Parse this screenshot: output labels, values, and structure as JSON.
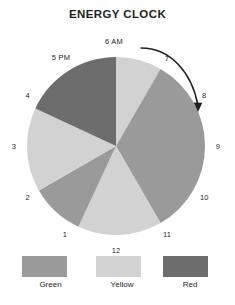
{
  "title": "ENERGY CLOCK",
  "colors": {
    "green": "#9a9a9a",
    "yellow": "#d2d2d2",
    "red": "#6d6d6d",
    "text": "#231f20",
    "background": "#ffffff",
    "arrow": "#231f20"
  },
  "legend": {
    "items": [
      {
        "label": "Green",
        "color": "#9a9a9a"
      },
      {
        "label": "Yellow",
        "color": "#d2d2d2"
      },
      {
        "label": "Red",
        "color": "#6d6d6d"
      }
    ]
  },
  "clock": {
    "labels": [
      {
        "text": "6 AM",
        "hour": 0
      },
      {
        "text": "7",
        "hour": 1
      },
      {
        "text": "8",
        "hour": 2
      },
      {
        "text": "9",
        "hour": 3
      },
      {
        "text": "10",
        "hour": 4
      },
      {
        "text": "11",
        "hour": 5
      },
      {
        "text": "12",
        "hour": 6
      },
      {
        "text": "1",
        "hour": 7
      },
      {
        "text": "2",
        "hour": 8
      },
      {
        "text": "3",
        "hour": 9
      },
      {
        "text": "4",
        "hour": 10
      },
      {
        "text": "5 PM",
        "hour": 11
      }
    ]
  },
  "arrow": {
    "name": "clockwise-direction-arrow",
    "from_label": "6 AM",
    "to_label": "9",
    "direction": "clockwise"
  },
  "chart_data": {
    "type": "pie",
    "title": "ENERGY CLOCK",
    "xlabel": "",
    "ylabel": "",
    "legend_position": "bottom",
    "start_angle_label": "6 AM",
    "rotation_deg": 0,
    "categories": [
      "Green",
      "Yellow",
      "Red"
    ],
    "category_colors": [
      "#9a9a9a",
      "#d2d2d2",
      "#6d6d6d"
    ],
    "slices": [
      {
        "category": "Yellow",
        "start_deg": 0,
        "end_deg": 30,
        "span_deg": 30,
        "hours": "6 AM - 7 AM",
        "value": 8.3
      },
      {
        "category": "Green",
        "start_deg": 30,
        "end_deg": 150,
        "span_deg": 120,
        "hours": "7 AM - 11 AM",
        "value": 33.3
      },
      {
        "category": "Yellow",
        "start_deg": 150,
        "end_deg": 205,
        "span_deg": 55,
        "hours": "11 AM - 1 PM",
        "value": 15.3
      },
      {
        "category": "Green",
        "start_deg": 205,
        "end_deg": 240,
        "span_deg": 35,
        "hours": "1 PM - 2 PM",
        "value": 9.7
      },
      {
        "category": "Yellow",
        "start_deg": 240,
        "end_deg": 295,
        "span_deg": 55,
        "hours": "2 PM - 4 PM",
        "value": 15.3
      },
      {
        "category": "Red",
        "start_deg": 295,
        "end_deg": 360,
        "span_deg": 65,
        "hours": "4 PM - 6 AM",
        "value": 18.1
      }
    ],
    "totals_deg": 360,
    "axis_tick_labels": [
      "6 AM",
      "7",
      "8",
      "9",
      "10",
      "11",
      "12",
      "1",
      "2",
      "3",
      "4",
      "5 PM"
    ],
    "grid": false
  }
}
